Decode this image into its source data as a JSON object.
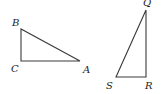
{
  "figure": {
    "width": 162,
    "height": 94,
    "line_color": "#3a3a3a",
    "label_color": "#222222",
    "triangles": [
      {
        "name": "ABC",
        "right_angle_at": "C",
        "vertices": {
          "A": {
            "x": 80,
            "y": 61
          },
          "B": {
            "x": 21,
            "y": 29
          },
          "C": {
            "x": 21,
            "y": 61
          }
        },
        "labels": {
          "A": {
            "text": "A",
            "x": 83,
            "y": 73
          },
          "B": {
            "text": "B",
            "x": 12,
            "y": 26
          },
          "C": {
            "text": "C",
            "x": 11,
            "y": 72
          }
        }
      },
      {
        "name": "QRS",
        "right_angle_at": "R",
        "vertices": {
          "Q": {
            "x": 146,
            "y": 10
          },
          "R": {
            "x": 146,
            "y": 77
          },
          "S": {
            "x": 116,
            "y": 77
          }
        },
        "labels": {
          "Q": {
            "text": "Q",
            "x": 143,
            "y": 6
          },
          "R": {
            "text": "R",
            "x": 145,
            "y": 89
          },
          "S": {
            "text": "S",
            "x": 106,
            "y": 89
          }
        }
      }
    ]
  }
}
